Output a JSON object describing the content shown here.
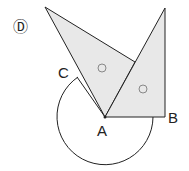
{
  "figure_label": "Ⓓ",
  "points": {
    "A": "A",
    "B": "B",
    "C": "C"
  },
  "colors": {
    "fill": "#e8e8e8",
    "stroke": "#222222"
  }
}
